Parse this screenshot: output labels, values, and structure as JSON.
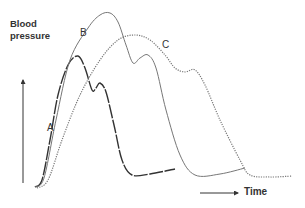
{
  "chart_data": {
    "type": "line",
    "title": "",
    "xlabel": "Time",
    "ylabel": "Blood pressure",
    "grid": false,
    "legend": "inline labels",
    "axes": {
      "ticks": "none",
      "style": "arrows"
    },
    "series": [
      {
        "name": "A",
        "style": "dark dashed",
        "color": "#333333",
        "points": [
          [
            35,
            187
          ],
          [
            42,
            180
          ],
          [
            50,
            140
          ],
          [
            58,
            95
          ],
          [
            68,
            65
          ],
          [
            78,
            56
          ],
          [
            85,
            68
          ],
          [
            92,
            90
          ],
          [
            96,
            88
          ],
          [
            100,
            83
          ],
          [
            106,
            92
          ],
          [
            114,
            125
          ],
          [
            122,
            160
          ],
          [
            132,
            175
          ],
          [
            150,
            174
          ],
          [
            175,
            169
          ]
        ]
      },
      {
        "name": "B",
        "style": "solid gray",
        "color": "#777777",
        "points": [
          [
            35,
            187
          ],
          [
            44,
            178
          ],
          [
            56,
            120
          ],
          [
            70,
            60
          ],
          [
            88,
            28
          ],
          [
            100,
            15
          ],
          [
            110,
            13
          ],
          [
            118,
            22
          ],
          [
            126,
            45
          ],
          [
            133,
            63
          ],
          [
            140,
            58
          ],
          [
            148,
            55
          ],
          [
            156,
            68
          ],
          [
            166,
            110
          ],
          [
            180,
            155
          ],
          [
            195,
            175
          ],
          [
            220,
            174
          ],
          [
            245,
            168
          ]
        ]
      },
      {
        "name": "C",
        "style": "dotted",
        "color": "#777777",
        "points": [
          [
            37,
            188
          ],
          [
            48,
            180
          ],
          [
            62,
            140
          ],
          [
            80,
            95
          ],
          [
            100,
            60
          ],
          [
            118,
            40
          ],
          [
            135,
            35
          ],
          [
            150,
            40
          ],
          [
            165,
            55
          ],
          [
            175,
            68
          ],
          [
            185,
            72
          ],
          [
            195,
            70
          ],
          [
            205,
            85
          ],
          [
            220,
            120
          ],
          [
            240,
            160
          ],
          [
            250,
            175
          ],
          [
            270,
            177
          ],
          [
            292,
            176
          ]
        ]
      }
    ],
    "annotations": [
      {
        "text": "A",
        "x": 50,
        "y": 128
      },
      {
        "text": "B",
        "x": 83,
        "y": 33
      },
      {
        "text": "C",
        "x": 165,
        "y": 45
      }
    ]
  },
  "labels": {
    "ylabel_line1": "Blood",
    "ylabel_line2": "pressure",
    "xlabel": "Time",
    "a": "A",
    "b": "B",
    "c": "C"
  }
}
